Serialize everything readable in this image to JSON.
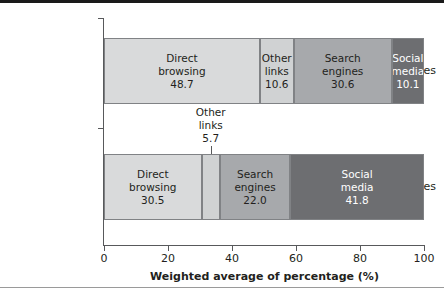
{
  "chart_data": {
    "type": "bar",
    "orientation": "horizontal",
    "stacked": true,
    "title": "",
    "xlabel": "Weighted average of percentage (%)",
    "ylabel": "",
    "xlim": [
      0,
      100
    ],
    "xticks": [
      0,
      20,
      40,
      60,
      80,
      100
    ],
    "xtick_labels": [
      "0",
      "20",
      "40",
      "60",
      "80",
      "100"
    ],
    "grid": false,
    "legend": "none",
    "categories": [
      "Top news sites",
      "Fake news sites"
    ],
    "series": [
      {
        "name": "Direct browsing",
        "values": [
          48.7,
          30.5
        ],
        "color": "#d9dadb"
      },
      {
        "name": "Other links",
        "values": [
          10.6,
          5.7
        ],
        "color": "#d0d2d3"
      },
      {
        "name": "Search engines",
        "values": [
          30.6,
          22.0
        ],
        "color": "#a7a9ac"
      },
      {
        "name": "Social media",
        "values": [
          10.1,
          41.8
        ],
        "color": "#6d6e71"
      }
    ],
    "bars": [
      {
        "category": "Top news sites",
        "segments": [
          {
            "label_line1": "Direct",
            "label_line2": "browsing",
            "value": "48.7",
            "value_num": 48.7,
            "color": "#d9dadb",
            "text_color": "#231f20",
            "label_inside": true
          },
          {
            "label_line1": "Other",
            "label_line2": "links",
            "value": "10.6",
            "value_num": 10.6,
            "color": "#d0d2d3",
            "text_color": "#231f20",
            "label_inside": true
          },
          {
            "label_line1": "Search",
            "label_line2": "engines",
            "value": "30.6",
            "value_num": 30.6,
            "color": "#a7a9ac",
            "text_color": "#231f20",
            "label_inside": true
          },
          {
            "label_line1": "Social",
            "label_line2": "media",
            "value": "10.1",
            "value_num": 10.1,
            "color": "#6d6e71",
            "text_color": "#ffffff",
            "label_inside": true
          }
        ]
      },
      {
        "category": "Fake news sites",
        "segments": [
          {
            "label_line1": "Direct",
            "label_line2": "browsing",
            "value": "30.5",
            "value_num": 30.5,
            "color": "#d9dadb",
            "text_color": "#231f20",
            "label_inside": true
          },
          {
            "label_line1": "Other",
            "label_line2": "links",
            "value": "5.7",
            "value_num": 5.7,
            "color": "#d0d2d3",
            "text_color": "#231f20",
            "label_inside": false
          },
          {
            "label_line1": "Search",
            "label_line2": "engines",
            "value": "22.0",
            "value_num": 22.0,
            "color": "#a7a9ac",
            "text_color": "#231f20",
            "label_inside": true
          },
          {
            "label_line1": "Social",
            "label_line2": "media",
            "value": "41.8",
            "value_num": 41.8,
            "color": "#6d6e71",
            "text_color": "#ffffff",
            "label_inside": true
          }
        ]
      }
    ],
    "callouts": [
      {
        "line1": "Other",
        "line2": "links",
        "line3": "5.7"
      }
    ],
    "colors": {
      "direct_browsing": "#d9dadb",
      "other_links": "#d0d2d3",
      "search_engines": "#a7a9ac",
      "social_media": "#6d6e71",
      "axis": "#58595b",
      "segment_border": "#808285",
      "text": "#231f20",
      "text_on_dark": "#ffffff",
      "top_rule": "#1a1a1a",
      "bottom_rule": "#9a9a9a"
    }
  }
}
